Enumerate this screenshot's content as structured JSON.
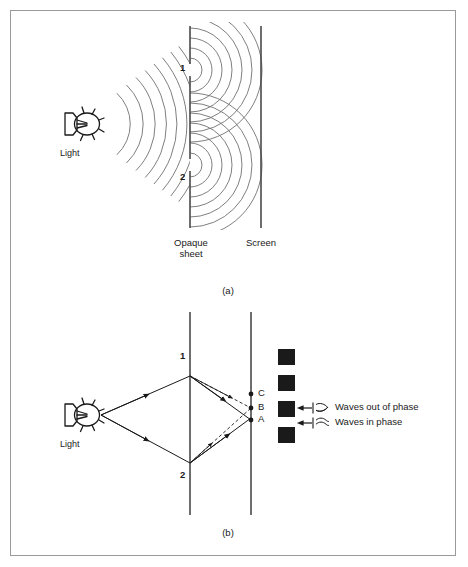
{
  "figure": {
    "title_implicit": "Young's double-slit interference diagram",
    "border_color": "#9a9a9a",
    "background": "#ffffff",
    "ink_color": "#1a1a1a",
    "wave_color": "#707070"
  },
  "panel_a": {
    "caption": "(a)",
    "source_label": "Light",
    "slit_labels": [
      "1",
      "2"
    ],
    "barrier_label_line1": "Opaque",
    "barrier_label_line2": "sheet",
    "screen_label": "Screen",
    "incident_wavefront_count": 7,
    "diffracted_wavefront_count_per_slit": 6,
    "description": "Light source emits circular wavefronts that strike an opaque sheet with two slits; each slit becomes a source of new circular wavefronts that overlap beyond the sheet and reach the screen."
  },
  "panel_b": {
    "caption": "(b)",
    "source_label": "Light",
    "slit_labels": [
      "1",
      "2"
    ],
    "screen_points": [
      "C",
      "B",
      "A"
    ],
    "fringe_count": 4,
    "fringe_color": "#1a1a1a",
    "legend": [
      {
        "id": "out-of-phase",
        "text": "Waves out of phase",
        "symbol": "crossed-waves"
      },
      {
        "id": "in-phase",
        "text": "Waves in phase",
        "symbol": "parallel-waves"
      }
    ],
    "description": "Ray diagram: rays from the light source pass through slits 1 and 2 and recombine at points A, B and C on the screen, producing bright and dark fringes."
  }
}
